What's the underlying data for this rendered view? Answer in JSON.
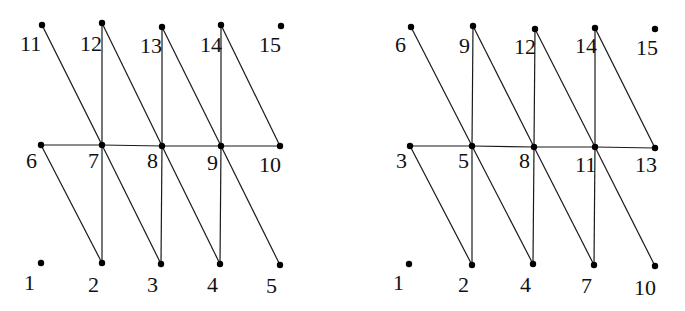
{
  "colors": {
    "edge": "#1a1a1a",
    "node": "#000000",
    "label": "#111111",
    "background": "#ffffff"
  },
  "graphs": [
    {
      "id": "left-graph",
      "nodes": [
        {
          "label": "1",
          "x": 41,
          "y": 263,
          "lx": 24,
          "ly": 290
        },
        {
          "label": "2",
          "x": 102,
          "y": 263,
          "lx": 88,
          "ly": 292
        },
        {
          "label": "3",
          "x": 161,
          "y": 264,
          "lx": 147,
          "ly": 292
        },
        {
          "label": "4",
          "x": 220,
          "y": 264,
          "lx": 207,
          "ly": 292
        },
        {
          "label": "5",
          "x": 280,
          "y": 265,
          "lx": 266,
          "ly": 293
        },
        {
          "label": "6",
          "x": 41,
          "y": 145,
          "lx": 26,
          "ly": 168
        },
        {
          "label": "7",
          "x": 102,
          "y": 145,
          "lx": 88,
          "ly": 168
        },
        {
          "label": "8",
          "x": 162,
          "y": 146,
          "lx": 147,
          "ly": 168
        },
        {
          "label": "9",
          "x": 221,
          "y": 146,
          "lx": 207,
          "ly": 170
        },
        {
          "label": "10",
          "x": 280,
          "y": 146,
          "lx": 259,
          "ly": 172
        },
        {
          "label": "11",
          "x": 42,
          "y": 25,
          "lx": 20,
          "ly": 51
        },
        {
          "label": "12",
          "x": 102,
          "y": 23,
          "lx": 80,
          "ly": 51
        },
        {
          "label": "13",
          "x": 162,
          "y": 27,
          "lx": 140,
          "ly": 53
        },
        {
          "label": "14",
          "x": 221,
          "y": 25,
          "lx": 200,
          "ly": 52
        },
        {
          "label": "15",
          "x": 281,
          "y": 26,
          "lx": 259,
          "ly": 52
        }
      ],
      "edges": [
        [
          "6",
          "7"
        ],
        [
          "7",
          "8"
        ],
        [
          "8",
          "9"
        ],
        [
          "9",
          "10"
        ],
        [
          "12",
          "7"
        ],
        [
          "7",
          "2"
        ],
        [
          "13",
          "8"
        ],
        [
          "8",
          "3"
        ],
        [
          "14",
          "9"
        ],
        [
          "9",
          "4"
        ],
        [
          "11",
          "7"
        ],
        [
          "12",
          "8"
        ],
        [
          "13",
          "9"
        ],
        [
          "14",
          "10"
        ],
        [
          "6",
          "2"
        ],
        [
          "7",
          "3"
        ],
        [
          "8",
          "4"
        ],
        [
          "9",
          "5"
        ]
      ]
    },
    {
      "id": "right-graph",
      "nodes": [
        {
          "label": "1",
          "x": 409,
          "y": 264,
          "lx": 393,
          "ly": 290
        },
        {
          "label": "2",
          "x": 472,
          "y": 265,
          "lx": 458,
          "ly": 292
        },
        {
          "label": "4",
          "x": 533,
          "y": 264,
          "lx": 520,
          "ly": 292
        },
        {
          "label": "7",
          "x": 594,
          "y": 265,
          "lx": 581,
          "ly": 293
        },
        {
          "label": "10",
          "x": 655,
          "y": 266,
          "lx": 634,
          "ly": 295
        },
        {
          "label": "3",
          "x": 410,
          "y": 146,
          "lx": 396,
          "ly": 168
        },
        {
          "label": "5",
          "x": 472,
          "y": 146,
          "lx": 458,
          "ly": 168
        },
        {
          "label": "8",
          "x": 534,
          "y": 147,
          "lx": 519,
          "ly": 168
        },
        {
          "label": "11",
          "x": 595,
          "y": 147,
          "lx": 575,
          "ly": 172
        },
        {
          "label": "13",
          "x": 655,
          "y": 148,
          "lx": 635,
          "ly": 172
        },
        {
          "label": "6",
          "x": 411,
          "y": 27,
          "lx": 395,
          "ly": 52
        },
        {
          "label": "9",
          "x": 473,
          "y": 26,
          "lx": 459,
          "ly": 53
        },
        {
          "label": "12",
          "x": 535,
          "y": 29,
          "lx": 514,
          "ly": 54
        },
        {
          "label": "14",
          "x": 595,
          "y": 28,
          "lx": 575,
          "ly": 53
        },
        {
          "label": "15",
          "x": 655,
          "y": 29,
          "lx": 636,
          "ly": 55
        }
      ],
      "edges": [
        [
          "3",
          "5"
        ],
        [
          "5",
          "8"
        ],
        [
          "8",
          "11"
        ],
        [
          "11",
          "13"
        ],
        [
          "9",
          "5"
        ],
        [
          "5",
          "2"
        ],
        [
          "12",
          "8"
        ],
        [
          "8",
          "4"
        ],
        [
          "14",
          "11"
        ],
        [
          "11",
          "7"
        ],
        [
          "6",
          "5"
        ],
        [
          "9",
          "8"
        ],
        [
          "12",
          "11"
        ],
        [
          "14",
          "13"
        ],
        [
          "3",
          "2"
        ],
        [
          "5",
          "4"
        ],
        [
          "8",
          "7"
        ],
        [
          "11",
          "10"
        ]
      ]
    }
  ]
}
